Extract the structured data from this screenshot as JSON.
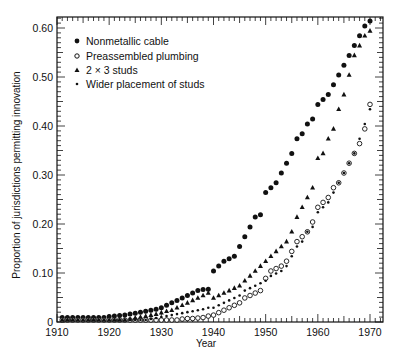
{
  "chart_data": {
    "type": "scatter",
    "title": "",
    "xlabel": "Year",
    "ylabel": "Proportion of jurisdictions permitting innovation",
    "xlim": [
      1910,
      1972
    ],
    "ylim": [
      0,
      0.62
    ],
    "xticks": [
      1910,
      1920,
      1930,
      1940,
      1950,
      1960,
      1970
    ],
    "xtick_labels": [
      "1910",
      "1920",
      "1930",
      "1940",
      "1950",
      "1960",
      "1970"
    ],
    "yticks": [
      0,
      0.1,
      0.2,
      0.3,
      0.4,
      0.5,
      0.6
    ],
    "ytick_labels": [
      "0",
      "0.10",
      "0.20",
      "0.30",
      "0.40",
      "0.50",
      "0.60"
    ],
    "grid": false,
    "legend_position": "upper-left",
    "x": [
      1911,
      1912,
      1913,
      1914,
      1915,
      1916,
      1917,
      1918,
      1919,
      1920,
      1921,
      1922,
      1923,
      1924,
      1925,
      1926,
      1927,
      1928,
      1929,
      1930,
      1931,
      1932,
      1933,
      1934,
      1935,
      1936,
      1937,
      1938,
      1939,
      1940,
      1941,
      1942,
      1943,
      1944,
      1945,
      1946,
      1947,
      1948,
      1949,
      1950,
      1951,
      1952,
      1953,
      1954,
      1955,
      1956,
      1957,
      1958,
      1959,
      1960,
      1961,
      1962,
      1963,
      1964,
      1965,
      1966,
      1967,
      1968,
      1969,
      1970
    ],
    "series": [
      {
        "name": "Nonmetallic cable",
        "marker": "filled-circle",
        "values": [
          0.005,
          0.005,
          0.005,
          0.005,
          0.005,
          0.005,
          0.005,
          0.005,
          0.005,
          0.007,
          0.008,
          0.009,
          0.01,
          0.012,
          0.014,
          0.016,
          0.018,
          0.02,
          0.022,
          0.025,
          0.03,
          0.035,
          0.04,
          0.045,
          0.05,
          0.055,
          0.06,
          0.062,
          0.063,
          0.1,
          0.11,
          0.12,
          0.125,
          0.13,
          0.15,
          0.17,
          0.19,
          0.21,
          0.215,
          0.26,
          0.27,
          0.28,
          0.3,
          0.32,
          0.34,
          0.37,
          0.38,
          0.4,
          0.41,
          0.44,
          0.45,
          0.46,
          0.48,
          0.5,
          0.52,
          0.54,
          0.56,
          0.58,
          0.6,
          0.61
        ]
      },
      {
        "name": "Preassembled plumbing",
        "marker": "open-circle",
        "values": [
          0,
          0,
          0,
          0,
          0,
          0,
          0,
          0,
          0,
          0,
          0,
          0,
          0,
          0,
          0,
          0,
          0,
          0,
          0,
          0,
          0,
          0,
          0,
          0.002,
          0.003,
          0.003,
          0.004,
          0.005,
          0.008,
          0.01,
          0.015,
          0.02,
          0.025,
          0.03,
          0.035,
          0.045,
          0.05,
          0.055,
          0.06,
          0.085,
          0.1,
          0.105,
          0.11,
          0.12,
          0.14,
          0.16,
          0.17,
          0.18,
          0.2,
          0.23,
          0.24,
          0.25,
          0.27,
          0.28,
          0.3,
          0.32,
          0.34,
          0.36,
          0.39,
          0.44
        ]
      },
      {
        "name": "2 × 3 studs",
        "marker": "filled-triangle",
        "values": [
          0,
          0,
          0,
          0,
          0,
          0,
          0,
          0,
          0,
          0,
          0,
          0,
          0,
          0.002,
          0.004,
          0.006,
          0.008,
          0.01,
          0.012,
          0.015,
          0.018,
          0.02,
          0.025,
          0.03,
          0.035,
          0.04,
          0.045,
          0.05,
          0.055,
          0.045,
          0.05,
          0.055,
          0.06,
          0.065,
          0.07,
          0.08,
          0.09,
          0.1,
          0.11,
          0.12,
          0.13,
          0.14,
          0.15,
          0.16,
          0.18,
          0.21,
          0.23,
          0.25,
          0.27,
          0.33,
          0.34,
          0.37,
          0.39,
          0.43,
          0.46,
          0.5,
          0.54,
          0.56,
          0.58,
          0.59
        ]
      },
      {
        "name": "Wider placement of studs",
        "marker": "small-dot",
        "values": [
          0,
          0,
          0,
          0,
          0,
          0,
          0,
          0,
          0,
          0,
          0,
          0,
          0,
          0,
          0,
          0,
          0,
          0.002,
          0.004,
          0.006,
          0.008,
          0.01,
          0.012,
          0.014,
          0.016,
          0.018,
          0.02,
          0.022,
          0.025,
          0.025,
          0.03,
          0.035,
          0.04,
          0.045,
          0.05,
          0.06,
          0.065,
          0.07,
          0.075,
          0.08,
          0.09,
          0.095,
          0.1,
          0.11,
          0.13,
          0.15,
          0.16,
          0.18,
          0.19,
          0.22,
          0.23,
          0.24,
          0.26,
          0.28,
          0.3,
          0.32,
          0.34,
          0.37,
          0.4,
          0.43
        ]
      }
    ]
  },
  "legend": {
    "items": [
      {
        "label": "Nonmetallic cable",
        "marker": "filled-circle"
      },
      {
        "label": "Preassembled plumbing",
        "marker": "open-circle"
      },
      {
        "label": "2 × 3 studs",
        "marker": "filled-triangle"
      },
      {
        "label": "Wider placement of studs",
        "marker": "small-dot"
      }
    ]
  },
  "axes": {
    "xlabel": "Year",
    "ylabel": "Proportion of jurisdictions permitting innovation"
  },
  "colors": {
    "ink": "#111111",
    "background": "#ffffff"
  }
}
